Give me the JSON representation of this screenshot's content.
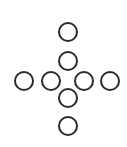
{
  "diagram": {
    "shape": "cross-of-circles",
    "stroke_color": "#2b2b2b",
    "fill_color": "#ffffff",
    "stroke_width": 2,
    "radius": 10,
    "circles": [
      {
        "id": "top-outer",
        "cx": 68,
        "cy": 32
      },
      {
        "id": "top-inner",
        "cx": 68,
        "cy": 61
      },
      {
        "id": "left-outer",
        "cx": 24,
        "cy": 81
      },
      {
        "id": "left-inner",
        "cx": 51,
        "cy": 81
      },
      {
        "id": "right-inner",
        "cx": 84,
        "cy": 81
      },
      {
        "id": "right-outer",
        "cx": 110,
        "cy": 81
      },
      {
        "id": "bottom-inner",
        "cx": 68,
        "cy": 98
      },
      {
        "id": "bottom-outer",
        "cx": 68,
        "cy": 126
      }
    ]
  }
}
